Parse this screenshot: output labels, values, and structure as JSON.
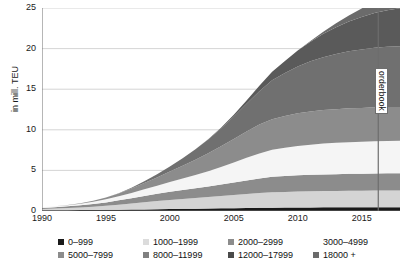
{
  "chart_data": {
    "type": "area",
    "title": "",
    "xlabel": "",
    "ylabel": "in mill. TEU",
    "xlim": [
      1990,
      2018
    ],
    "ylim": [
      0,
      25
    ],
    "grid": true,
    "stacked": true,
    "legend_position": "bottom",
    "xticks": [
      "1990",
      "1995",
      "2000",
      "2005",
      "2010",
      "2015"
    ],
    "xtick_values": [
      1990,
      1995,
      2000,
      2005,
      2010,
      2015
    ],
    "yticks": [
      "0",
      "5",
      "10",
      "15",
      "20",
      "25"
    ],
    "ytick_values": [
      0,
      5,
      10,
      15,
      20,
      25
    ],
    "x": [
      1990,
      1991,
      1992,
      1993,
      1994,
      1995,
      1996,
      1997,
      1998,
      1999,
      2000,
      2001,
      2002,
      2003,
      2004,
      2005,
      2006,
      2007,
      2008,
      2009,
      2010,
      2011,
      2012,
      2013,
      2014,
      2015,
      2016,
      2017,
      2018
    ],
    "series": [
      {
        "name": "0–999",
        "color": "#1a1a1a",
        "values": [
          0.08,
          0.09,
          0.1,
          0.11,
          0.12,
          0.14,
          0.16,
          0.18,
          0.2,
          0.22,
          0.25,
          0.27,
          0.29,
          0.31,
          0.33,
          0.35,
          0.37,
          0.39,
          0.41,
          0.42,
          0.43,
          0.44,
          0.45,
          0.45,
          0.46,
          0.46,
          0.47,
          0.47,
          0.47
        ]
      },
      {
        "name": "1000–1999",
        "color": "#d4d4d4",
        "values": [
          0.18,
          0.22,
          0.27,
          0.33,
          0.4,
          0.5,
          0.62,
          0.75,
          0.88,
          1.0,
          1.12,
          1.22,
          1.32,
          1.42,
          1.52,
          1.62,
          1.72,
          1.82,
          1.9,
          1.93,
          1.96,
          1.98,
          2.0,
          2.01,
          2.02,
          2.03,
          2.04,
          2.04,
          2.04
        ]
      },
      {
        "name": "2000–2999",
        "color": "#8c8c8c",
        "values": [
          0.12,
          0.16,
          0.2,
          0.26,
          0.33,
          0.42,
          0.53,
          0.65,
          0.78,
          0.9,
          1.0,
          1.1,
          1.2,
          1.3,
          1.42,
          1.55,
          1.68,
          1.8,
          1.9,
          1.95,
          2.0,
          2.03,
          2.06,
          2.08,
          2.1,
          2.11,
          2.12,
          2.13,
          2.13
        ]
      },
      {
        "name": "3000–4999",
        "color": "#f5f5f5",
        "values": [
          0.07,
          0.1,
          0.14,
          0.2,
          0.28,
          0.38,
          0.5,
          0.65,
          0.82,
          1.0,
          1.2,
          1.4,
          1.62,
          1.88,
          2.15,
          2.45,
          2.78,
          3.08,
          3.32,
          3.48,
          3.62,
          3.72,
          3.8,
          3.86,
          3.9,
          3.93,
          3.96,
          3.98,
          4.0
        ]
      },
      {
        "name": "5000–7999",
        "color": "#8c8c8c",
        "values": [
          0.0,
          0.01,
          0.03,
          0.06,
          0.12,
          0.22,
          0.36,
          0.55,
          0.78,
          1.02,
          1.3,
          1.58,
          1.88,
          2.2,
          2.55,
          2.9,
          3.25,
          3.55,
          3.78,
          3.92,
          4.02,
          4.08,
          4.12,
          4.14,
          4.16,
          4.17,
          4.18,
          4.18,
          4.18
        ]
      },
      {
        "name": "8000–11999",
        "color": "#707070",
        "values": [
          0.0,
          0.0,
          0.0,
          0.0,
          0.0,
          0.0,
          0.02,
          0.08,
          0.2,
          0.38,
          0.62,
          0.92,
          1.28,
          1.7,
          2.2,
          2.78,
          3.42,
          4.1,
          4.78,
          5.3,
          5.78,
          6.18,
          6.52,
          6.8,
          7.02,
          7.2,
          7.34,
          7.42,
          7.48
        ]
      },
      {
        "name": "12000–17999",
        "color": "#5a5a5a",
        "values": [
          0.0,
          0.0,
          0.0,
          0.0,
          0.0,
          0.0,
          0.0,
          0.0,
          0.0,
          0.0,
          0.0,
          0.0,
          0.0,
          0.02,
          0.08,
          0.2,
          0.4,
          0.68,
          1.05,
          1.48,
          1.95,
          2.42,
          2.88,
          3.3,
          3.68,
          4.0,
          4.28,
          4.5,
          4.68
        ]
      },
      {
        "name": "18000 +",
        "color": "#6b6b6b",
        "values": [
          0.0,
          0.0,
          0.0,
          0.0,
          0.0,
          0.0,
          0.0,
          0.0,
          0.0,
          0.0,
          0.0,
          0.0,
          0.0,
          0.0,
          0.0,
          0.0,
          0.0,
          0.0,
          0.0,
          0.0,
          0.02,
          0.1,
          0.25,
          0.48,
          0.75,
          1.05,
          1.35,
          1.62,
          1.85
        ]
      }
    ],
    "annotations": [
      {
        "type": "vline",
        "name": "orderbook-divider",
        "x": 2016.3,
        "label": "orderbook",
        "color": "#6e6e6e"
      }
    ]
  },
  "legend": {
    "rows": [
      [
        {
          "label": "0–999",
          "color": "#1a1a1a",
          "left": 58
        },
        {
          "label": "1000–1999",
          "color": "#dcdcdc",
          "left": 143
        },
        {
          "label": "2000–2999",
          "color": "#8c8c8c",
          "left": 228
        },
        {
          "label": "3000–4999",
          "color": "#ffffff",
          "left": 313
        }
      ],
      [
        {
          "label": "5000–7999",
          "color": "#8c8c8c",
          "left": 58
        },
        {
          "label": "8000–11999",
          "color": "#808080",
          "left": 143
        },
        {
          "label": "12000–17999",
          "color": "#4a4a4a",
          "left": 228
        },
        {
          "label": "18000 +",
          "color": "#6b6b6b",
          "left": 313
        }
      ]
    ]
  }
}
